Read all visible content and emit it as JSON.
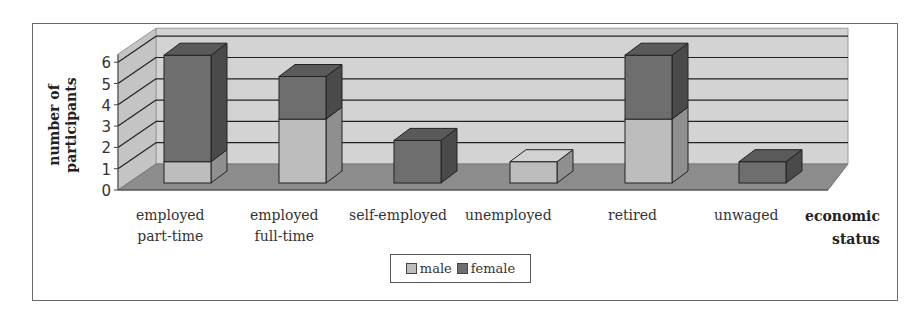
{
  "chart_data": {
    "type": "bar",
    "stacked": true,
    "three_d": true,
    "title": "",
    "xlabel": "economic status",
    "ylabel": "number of participants",
    "ylim": [
      0,
      6
    ],
    "yticks": [
      0,
      1,
      2,
      3,
      4,
      5,
      6
    ],
    "grid": true,
    "legend_position": "bottom",
    "categories": [
      "employed part-time",
      "employed full-time",
      "self-employed",
      "unemployed",
      "retired",
      "unwaged"
    ],
    "series": [
      {
        "name": "male",
        "color": "#bdbdbd",
        "values": [
          1,
          3,
          0,
          1,
          3,
          0
        ]
      },
      {
        "name": "female",
        "color": "#6e6e6e",
        "values": [
          5,
          2,
          2,
          0,
          3,
          1
        ]
      }
    ]
  },
  "axis": {
    "ylabel_line1": "number of",
    "ylabel_line2": "participants",
    "xlabel_line1": "economic",
    "xlabel_line2": "status",
    "ticks": [
      "0",
      "1",
      "2",
      "3",
      "4",
      "5",
      "6"
    ]
  },
  "categories_display": [
    {
      "line1": "employed",
      "line2": "part-time"
    },
    {
      "line1": "employed",
      "line2": "full-time"
    },
    {
      "line1": "self-employed",
      "line2": ""
    },
    {
      "line1": "unemployed",
      "line2": ""
    },
    {
      "line1": "retired",
      "line2": ""
    },
    {
      "line1": "unwaged",
      "line2": ""
    }
  ],
  "legend": {
    "male": "male",
    "female": "female"
  },
  "colors": {
    "male_front": "#bdbdbd",
    "male_side": "#8f8f8f",
    "male_top": "#d2d2d2",
    "female_front": "#6e6e6e",
    "female_side": "#4a4a4a",
    "female_top": "#5a5a5a",
    "wall_back": "#d3d3d3",
    "wall_side": "#c4c4c4",
    "floor": "#8c8c8c"
  }
}
